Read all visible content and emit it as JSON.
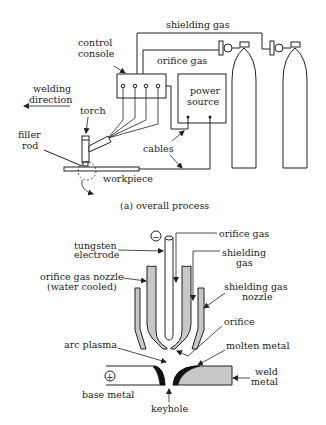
{
  "top_diagram": {
    "caption": "(a) overall process",
    "labels": {
      "shielding_gas": "shielding gas",
      "orifice_gas": "orifice gas",
      "control_console_1": "control",
      "control_console_2": "console",
      "power_source_1": "power",
      "power_source_2": "source",
      "welding_direction_1": "welding",
      "welding_direction_2": "direction",
      "torch": "torch",
      "filler_rod_1": "filler",
      "filler_rod_2": "rod",
      "cables": "cables",
      "workpiece": "workpiece"
    }
  },
  "bottom_diagram": {
    "labels": {
      "minus": "−",
      "plus": "+",
      "orifice_gas": "orifice gas",
      "tungsten_electrode_1": "tungsten",
      "tungsten_electrode_2": "electrode",
      "shielding_gas_1": "shielding",
      "shielding_gas_2": "gas",
      "orifice_nozzle_1": "orifice gas nozzle",
      "orifice_nozzle_2": "(water cooled)",
      "shielding_nozzle_1": "shielding gas",
      "shielding_nozzle_2": "nozzle",
      "orifice": "orifice",
      "arc_plasma": "arc plasma",
      "molten_metal": "molten metal",
      "weld_metal_1": "weld",
      "weld_metal_2": "metal",
      "base_metal": "base metal",
      "keyhole": "keyhole"
    }
  }
}
